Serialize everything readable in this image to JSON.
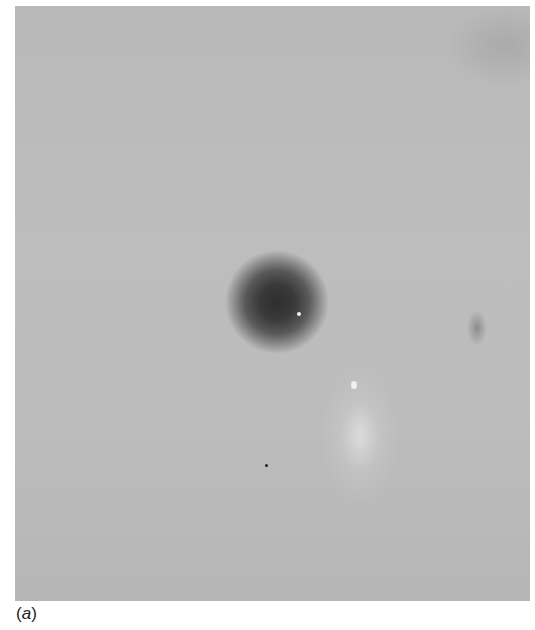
{
  "figure": {
    "panel_label_open": "(",
    "panel_label_letter": "a",
    "panel_label_close": ")"
  }
}
